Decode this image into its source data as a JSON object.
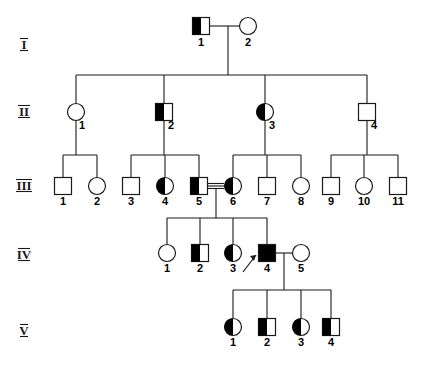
{
  "figure": {
    "kind": "pedigree-chart",
    "title": "",
    "symbol_size": 17,
    "colors": {
      "line": "#1a1a1a",
      "affected_fill": "#000000",
      "unaffected_fill": "#ffffff",
      "text": "#000000"
    },
    "legend_note": ""
  },
  "generation_labels": [
    {
      "text": "I",
      "x": 24,
      "y": 49
    },
    {
      "text": "II",
      "x": 24,
      "y": 116
    },
    {
      "text": "III",
      "x": 24,
      "y": 190
    },
    {
      "text": "IV",
      "x": 24,
      "y": 259
    },
    {
      "text": "V",
      "x": 24,
      "y": 335
    }
  ],
  "individuals": [
    {
      "id": "I-1",
      "generation": "I",
      "number": "1",
      "sex": "male",
      "status": "half",
      "cx": 201,
      "cy": 26,
      "label_x": 201,
      "label_y": 46
    },
    {
      "id": "I-2",
      "generation": "I",
      "number": "2",
      "sex": "female",
      "status": "unaffected",
      "cx": 248,
      "cy": 26,
      "label_x": 248,
      "label_y": 46
    },
    {
      "id": "II-1",
      "generation": "II",
      "number": "1",
      "sex": "female",
      "status": "unaffected",
      "cx": 76,
      "cy": 112,
      "label_x": 82,
      "label_y": 129
    },
    {
      "id": "II-2",
      "generation": "II",
      "number": "2",
      "sex": "male",
      "status": "half",
      "cx": 164,
      "cy": 112,
      "label_x": 171,
      "label_y": 129
    },
    {
      "id": "II-3",
      "generation": "II",
      "number": "3",
      "sex": "female",
      "status": "half",
      "cx": 265,
      "cy": 112,
      "label_x": 272,
      "label_y": 129
    },
    {
      "id": "II-4",
      "generation": "II",
      "number": "4",
      "sex": "male",
      "status": "unaffected",
      "cx": 367,
      "cy": 112,
      "label_x": 374,
      "label_y": 129
    },
    {
      "id": "III-1",
      "generation": "III",
      "number": "1",
      "sex": "male",
      "status": "unaffected",
      "cx": 63,
      "cy": 186,
      "label_x": 63,
      "label_y": 205
    },
    {
      "id": "III-2",
      "generation": "III",
      "number": "2",
      "sex": "female",
      "status": "unaffected",
      "cx": 97,
      "cy": 186,
      "label_x": 97,
      "label_y": 205
    },
    {
      "id": "III-3",
      "generation": "III",
      "number": "3",
      "sex": "male",
      "status": "unaffected",
      "cx": 131,
      "cy": 186,
      "label_x": 131,
      "label_y": 205
    },
    {
      "id": "III-4",
      "generation": "III",
      "number": "4",
      "sex": "female",
      "status": "half",
      "cx": 165,
      "cy": 186,
      "label_x": 165,
      "label_y": 205
    },
    {
      "id": "III-5",
      "generation": "III",
      "number": "5",
      "sex": "male",
      "status": "half",
      "cx": 199,
      "cy": 186,
      "label_x": 199,
      "label_y": 205
    },
    {
      "id": "III-6",
      "generation": "III",
      "number": "6",
      "sex": "female",
      "status": "half",
      "cx": 233,
      "cy": 186,
      "label_x": 233,
      "label_y": 205
    },
    {
      "id": "III-7",
      "generation": "III",
      "number": "7",
      "sex": "male",
      "status": "unaffected",
      "cx": 267,
      "cy": 186,
      "label_x": 267,
      "label_y": 205
    },
    {
      "id": "III-8",
      "generation": "III",
      "number": "8",
      "sex": "female",
      "status": "unaffected",
      "cx": 301,
      "cy": 186,
      "label_x": 301,
      "label_y": 205
    },
    {
      "id": "III-9",
      "generation": "III",
      "number": "9",
      "sex": "male",
      "status": "unaffected",
      "cx": 331,
      "cy": 186,
      "label_x": 331,
      "label_y": 205
    },
    {
      "id": "III-10",
      "generation": "III",
      "number": "10",
      "sex": "female",
      "status": "unaffected",
      "cx": 364,
      "cy": 186,
      "label_x": 364,
      "label_y": 205
    },
    {
      "id": "III-11",
      "generation": "III",
      "number": "11",
      "sex": "male",
      "status": "unaffected",
      "cx": 398,
      "cy": 186,
      "label_x": 398,
      "label_y": 205
    },
    {
      "id": "IV-1",
      "generation": "IV",
      "number": "1",
      "sex": "female",
      "status": "unaffected",
      "cx": 167,
      "cy": 253,
      "label_x": 167,
      "label_y": 272
    },
    {
      "id": "IV-2",
      "generation": "IV",
      "number": "2",
      "sex": "male",
      "status": "half",
      "cx": 200,
      "cy": 253,
      "label_x": 200,
      "label_y": 272
    },
    {
      "id": "IV-3",
      "generation": "IV",
      "number": "3",
      "sex": "female",
      "status": "half",
      "cx": 233,
      "cy": 253,
      "label_x": 233,
      "label_y": 272
    },
    {
      "id": "IV-4",
      "generation": "IV",
      "number": "4",
      "sex": "male",
      "status": "affected",
      "cx": 267,
      "cy": 253,
      "label_x": 267,
      "label_y": 272
    },
    {
      "id": "IV-5",
      "generation": "IV",
      "number": "5",
      "sex": "female",
      "status": "unaffected",
      "cx": 301,
      "cy": 253,
      "label_x": 301,
      "label_y": 272
    },
    {
      "id": "V-1",
      "generation": "V",
      "number": "1",
      "sex": "female",
      "status": "half",
      "cx": 233,
      "cy": 327,
      "label_x": 233,
      "label_y": 346
    },
    {
      "id": "V-2",
      "generation": "V",
      "number": "2",
      "sex": "male",
      "status": "half",
      "cx": 267,
      "cy": 327,
      "label_x": 267,
      "label_y": 346
    },
    {
      "id": "V-3",
      "generation": "V",
      "number": "3",
      "sex": "female",
      "status": "half",
      "cx": 301,
      "cy": 327,
      "label_x": 301,
      "label_y": 346
    },
    {
      "id": "V-4",
      "generation": "V",
      "number": "4",
      "sex": "male",
      "status": "half",
      "cx": 331,
      "cy": 327,
      "label_x": 331,
      "label_y": 346
    }
  ],
  "matings": [
    {
      "id": "mating-I1-I2",
      "type": "single",
      "partners": [
        "I-1",
        "I-2"
      ],
      "y": 26,
      "x1": 210,
      "x2": 239,
      "drop_x": 228,
      "drop_to": 75
    },
    {
      "id": "mating-III5-III6",
      "type": "consanguineous",
      "partners": [
        "III-5",
        "III-6"
      ],
      "y": 186,
      "x1": 208,
      "x2": 224,
      "drop_x": 216,
      "drop_to": 218
    },
    {
      "id": "mating-IV4-IV5",
      "type": "single",
      "partners": [
        "IV-4",
        "IV-5"
      ],
      "y": 253,
      "x1": 276,
      "x2": 292,
      "drop_x": 284,
      "drop_to": 290
    }
  ],
  "sibships": [
    {
      "id": "sibship-gen2",
      "parents": "mating-I1-I2",
      "line_y": 75,
      "x_from": 76,
      "x_to": 367,
      "children_x": [
        76,
        164,
        265,
        367
      ],
      "child_top_y": 103
    },
    {
      "id": "sibship-II1",
      "parents": "II-1",
      "line_y": 155,
      "x_from": 63,
      "x_to": 97,
      "children_x": [
        63,
        97
      ],
      "child_top_y": 177
    },
    {
      "id": "sibship-II2",
      "parents": "II-2",
      "line_y": 155,
      "x_from": 131,
      "x_to": 199,
      "children_x": [
        131,
        165,
        199
      ],
      "child_top_y": 177
    },
    {
      "id": "sibship-II3",
      "parents": "II-3",
      "line_y": 155,
      "x_from": 233,
      "x_to": 301,
      "children_x": [
        233,
        267,
        301
      ],
      "child_top_y": 177
    },
    {
      "id": "sibship-II4",
      "parents": "II-4",
      "line_y": 155,
      "x_from": 331,
      "x_to": 398,
      "children_x": [
        331,
        364,
        398
      ],
      "child_top_y": 177
    },
    {
      "id": "sibship-gen4",
      "parents": "mating-III5-III6",
      "line_y": 218,
      "x_from": 167,
      "x_to": 267,
      "children_x": [
        167,
        200,
        233,
        267
      ],
      "child_top_y": 244
    },
    {
      "id": "sibship-gen5",
      "parents": "mating-IV4-IV5",
      "line_y": 290,
      "x_from": 233,
      "x_to": 331,
      "children_x": [
        233,
        267,
        301,
        331
      ],
      "child_top_y": 318
    }
  ],
  "parent_stems": [
    {
      "id": "stem-II1",
      "x": 76,
      "y1": 121,
      "y2": 155
    },
    {
      "id": "stem-II2",
      "x": 164,
      "y1": 121,
      "y2": 155
    },
    {
      "id": "stem-II3",
      "x": 265,
      "y1": 121,
      "y2": 155
    },
    {
      "id": "stem-II4",
      "x": 367,
      "y1": 121,
      "y2": 155
    }
  ],
  "proband": {
    "id": "proband-arrow",
    "points_to": "IV-4",
    "x1": 243,
    "y1": 272,
    "x2": 256,
    "y2": 255,
    "head": "256,255 250,256 254,261"
  }
}
